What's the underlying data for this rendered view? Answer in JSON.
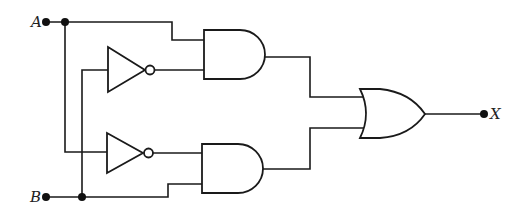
{
  "diagram": {
    "type": "logic-circuit",
    "inputs": [
      {
        "id": "A",
        "label": "A"
      },
      {
        "id": "B",
        "label": "B"
      }
    ],
    "output": {
      "id": "X",
      "label": "X"
    },
    "gates": [
      {
        "id": "not1",
        "type": "NOT",
        "input": "B"
      },
      {
        "id": "not2",
        "type": "NOT",
        "input": "A"
      },
      {
        "id": "and1",
        "type": "AND",
        "inputs": [
          "A",
          "not1"
        ]
      },
      {
        "id": "and2",
        "type": "AND",
        "inputs": [
          "not2",
          "B"
        ]
      },
      {
        "id": "or1",
        "type": "OR",
        "inputs": [
          "and1",
          "and2"
        ],
        "output": "X"
      }
    ],
    "colors": {
      "line": "#1a1a1a",
      "background": "#ffffff"
    }
  }
}
